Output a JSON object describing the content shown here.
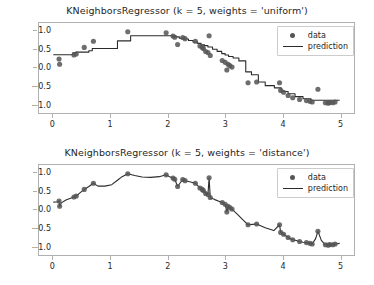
{
  "figure": {
    "background": "#ffffff",
    "width": 374,
    "height": 285
  },
  "style": {
    "marker_color": "#555555",
    "line_color": "#2b2b2b",
    "axis_color": "#b0b0b0",
    "text_color": "#262626"
  },
  "legend": {
    "data_label": "data",
    "prediction_label": "prediction"
  },
  "axis": {
    "xticks": [
      0,
      1,
      2,
      3,
      4,
      5
    ],
    "xtick_labels": [
      "0",
      "1",
      "2",
      "3",
      "4",
      "5"
    ],
    "yticks": [
      1.0,
      0.5,
      0.0,
      -0.5,
      -1.0
    ],
    "ytick_labels": [
      "1.0",
      "0.5",
      "0.0",
      "−0.5",
      "−1.0"
    ],
    "xlim": [
      -0.25,
      5.25
    ],
    "ylim": [
      -1.25,
      1.22
    ]
  },
  "chart_data": [
    {
      "type": "scatter",
      "title": "KNeighborsRegressor (k = 5, weights = 'uniform')",
      "xlabel": "",
      "ylabel": "",
      "xlim": [
        -0.25,
        5.25
      ],
      "ylim": [
        -1.25,
        1.22
      ],
      "grid": false,
      "legend_position": "upper right",
      "series": [
        {
          "name": "data",
          "type": "scatter",
          "color": "#555555",
          "x": [
            0.1,
            0.11,
            0.36,
            0.4,
            0.54,
            0.7,
            1.3,
            1.97,
            2.09,
            2.12,
            2.17,
            2.26,
            2.3,
            2.48,
            2.56,
            2.6,
            2.62,
            2.66,
            2.7,
            2.72,
            2.74,
            2.95,
            3.0,
            3.03,
            3.05,
            3.08,
            3.12,
            3.4,
            3.55,
            3.95,
            3.97,
            4.02,
            4.1,
            4.18,
            4.3,
            4.42,
            4.48,
            4.52,
            4.62,
            4.75,
            4.8,
            4.83,
            4.88,
            4.92
          ],
          "y": [
            0.23,
            0.09,
            0.34,
            0.37,
            0.55,
            0.72,
            0.98,
            0.95,
            0.86,
            0.83,
            0.63,
            0.82,
            0.79,
            0.72,
            0.59,
            0.55,
            0.52,
            0.44,
            0.41,
            0.87,
            0.33,
            0.19,
            0.14,
            -0.07,
            0.09,
            0.05,
            0.01,
            -0.42,
            -0.4,
            -0.42,
            -0.63,
            -0.68,
            -0.77,
            -0.83,
            -0.88,
            -0.91,
            -0.93,
            -0.95,
            -0.6,
            -0.97,
            -0.98,
            -0.96,
            -0.97,
            -0.95
          ]
        },
        {
          "name": "prediction",
          "type": "step",
          "color": "#2b2b2b",
          "description": "k=5 uniform-weighted nearest neighbor step prediction over x in [0,5]",
          "x": [
            0.0,
            0.3,
            0.34,
            0.4,
            0.62,
            0.68,
            1.05,
            1.12,
            1.35,
            1.9,
            2.02,
            2.08,
            2.14,
            2.2,
            2.28,
            2.36,
            2.44,
            2.52,
            2.58,
            2.64,
            2.7,
            2.78,
            2.86,
            2.94,
            3.0,
            3.06,
            3.14,
            3.24,
            3.36,
            3.46,
            3.58,
            3.7,
            3.86,
            3.98,
            4.1,
            4.22,
            4.36,
            4.5,
            4.66,
            4.8,
            5.0
          ],
          "y": [
            0.35,
            0.35,
            0.4,
            0.42,
            0.46,
            0.52,
            0.52,
            0.73,
            0.87,
            0.87,
            0.87,
            0.86,
            0.84,
            0.8,
            0.78,
            0.74,
            0.7,
            0.66,
            0.62,
            0.6,
            0.56,
            0.5,
            0.44,
            0.38,
            0.34,
            0.3,
            0.26,
            0.18,
            -0.12,
            -0.2,
            -0.4,
            -0.5,
            -0.56,
            -0.66,
            -0.72,
            -0.8,
            -0.86,
            -0.9,
            -0.9,
            -0.9,
            -0.9
          ]
        }
      ]
    },
    {
      "type": "scatter",
      "title": "KNeighborsRegressor (k = 5, weights = 'distance')",
      "xlabel": "",
      "ylabel": "",
      "xlim": [
        -0.25,
        5.25
      ],
      "ylim": [
        -1.25,
        1.22
      ],
      "grid": false,
      "legend_position": "upper right",
      "series": [
        {
          "name": "data",
          "type": "scatter",
          "color": "#555555",
          "x": [
            0.1,
            0.11,
            0.36,
            0.4,
            0.54,
            0.7,
            1.3,
            1.97,
            2.09,
            2.12,
            2.17,
            2.26,
            2.3,
            2.48,
            2.56,
            2.6,
            2.62,
            2.66,
            2.7,
            2.72,
            2.74,
            2.95,
            3.0,
            3.03,
            3.05,
            3.08,
            3.12,
            3.4,
            3.55,
            3.95,
            3.97,
            4.02,
            4.1,
            4.18,
            4.3,
            4.42,
            4.48,
            4.52,
            4.62,
            4.75,
            4.8,
            4.83,
            4.88,
            4.92
          ],
          "y": [
            0.23,
            0.09,
            0.34,
            0.37,
            0.55,
            0.72,
            0.98,
            0.95,
            0.86,
            0.83,
            0.63,
            0.82,
            0.79,
            0.72,
            0.59,
            0.55,
            0.52,
            0.44,
            0.41,
            0.87,
            0.33,
            0.19,
            0.14,
            -0.07,
            0.09,
            0.05,
            0.01,
            -0.42,
            -0.4,
            -0.42,
            -0.63,
            -0.68,
            -0.77,
            -0.83,
            -0.88,
            -0.91,
            -0.93,
            -0.95,
            -0.6,
            -0.97,
            -0.98,
            -0.96,
            -0.97,
            -0.95
          ]
        },
        {
          "name": "prediction",
          "type": "line",
          "color": "#2b2b2b",
          "description": "k=5 distance-weighted nearest neighbor prediction; curve interpolates each training point producing sharp spikes at outliers",
          "x": [
            0.0,
            0.08,
            0.1,
            0.11,
            0.14,
            0.22,
            0.3,
            0.36,
            0.4,
            0.46,
            0.54,
            0.62,
            0.7,
            0.78,
            0.9,
            1.02,
            1.12,
            1.2,
            1.3,
            1.42,
            1.55,
            1.7,
            1.85,
            1.97,
            2.03,
            2.09,
            2.12,
            2.17,
            2.22,
            2.26,
            2.3,
            2.38,
            2.48,
            2.56,
            2.6,
            2.62,
            2.66,
            2.7,
            2.72,
            2.74,
            2.82,
            2.9,
            2.95,
            3.0,
            3.03,
            3.05,
            3.08,
            3.12,
            3.22,
            3.32,
            3.4,
            3.48,
            3.55,
            3.7,
            3.85,
            3.95,
            3.97,
            4.02,
            4.1,
            4.18,
            4.24,
            4.3,
            4.36,
            4.42,
            4.48,
            4.52,
            4.58,
            4.62,
            4.68,
            4.75,
            4.8,
            4.83,
            4.88,
            4.92,
            5.0
          ],
          "y": [
            0.2,
            0.21,
            0.23,
            0.09,
            0.18,
            0.26,
            0.31,
            0.34,
            0.37,
            0.45,
            0.55,
            0.63,
            0.72,
            0.64,
            0.64,
            0.68,
            0.8,
            0.9,
            0.98,
            0.93,
            0.89,
            0.88,
            0.9,
            0.95,
            0.9,
            0.86,
            0.83,
            0.63,
            0.74,
            0.82,
            0.79,
            0.76,
            0.72,
            0.59,
            0.55,
            0.52,
            0.44,
            0.41,
            0.87,
            0.33,
            0.27,
            0.22,
            0.19,
            0.14,
            -0.07,
            0.09,
            0.05,
            0.01,
            -0.14,
            -0.3,
            -0.42,
            -0.41,
            -0.4,
            -0.5,
            -0.58,
            -0.42,
            -0.63,
            -0.68,
            -0.77,
            -0.83,
            -0.85,
            -0.88,
            -0.9,
            -0.91,
            -0.93,
            -0.95,
            -0.8,
            -0.6,
            -0.85,
            -0.97,
            -0.98,
            -0.96,
            -0.97,
            -0.95,
            -0.93
          ]
        }
      ]
    }
  ]
}
